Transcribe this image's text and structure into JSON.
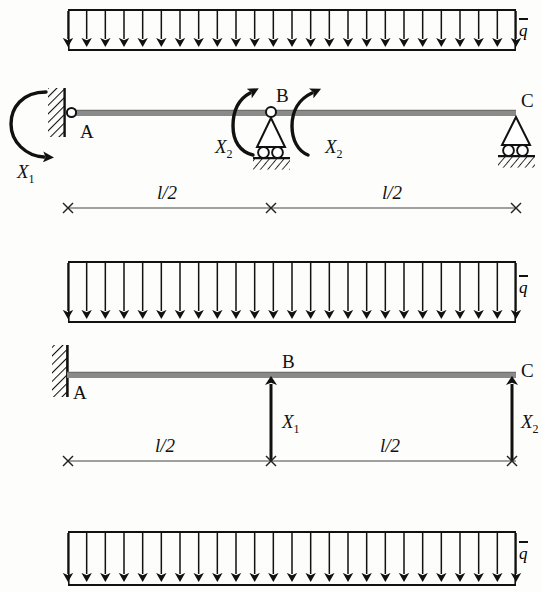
{
  "figure": {
    "type": "structural-engineering-diagram",
    "background_color": "#fdfdfb",
    "ink_color": "#111111",
    "beam_color": "#8a8a8a",
    "width": 542,
    "height": 592
  },
  "labels": {
    "point_a": "A",
    "point_b": "B",
    "point_c": "C",
    "load_q": "q",
    "half_span": "l/2",
    "x1": "X",
    "x1_sub": "1",
    "x2": "X",
    "x2_sub": "2"
  },
  "diagrams": [
    {
      "id": "primary-system-moments",
      "index": 1,
      "load": {
        "name": "uniformly-distributed-load",
        "symbol": "q",
        "overbar": true,
        "direction": "downward",
        "arrow_count": 25,
        "box_left": 68,
        "box_right": 516,
        "box_top": 10,
        "box_bottom": 50
      },
      "beam": {
        "left": 68,
        "right": 516,
        "y": 113
      },
      "supports": [
        {
          "name": "support-a",
          "label": "A",
          "type": "wall-hinge",
          "x": 68
        },
        {
          "name": "support-b",
          "label": "B",
          "type": "roller-hinge",
          "x": 271
        },
        {
          "name": "support-c",
          "label": "C",
          "type": "roller",
          "x": 516
        }
      ],
      "redundants": [
        {
          "name": "moment-x1",
          "label": "X",
          "sub": "1",
          "type": "moment",
          "at": "A"
        },
        {
          "name": "moment-x2-left",
          "label": "X",
          "sub": "2",
          "type": "moment",
          "at": "B-left"
        },
        {
          "name": "moment-x2-right",
          "label": "X",
          "sub": "2",
          "type": "moment",
          "at": "B-right"
        }
      ],
      "dimensions": [
        {
          "name": "dim-left-half",
          "label": "l/2",
          "from": 68,
          "to": 271,
          "y": 208
        },
        {
          "name": "dim-right-half",
          "label": "l/2",
          "from": 271,
          "to": 516,
          "y": 208
        }
      ]
    },
    {
      "id": "primary-system-forces",
      "index": 2,
      "load": {
        "name": "uniformly-distributed-load",
        "symbol": "q",
        "overbar": true,
        "direction": "downward",
        "arrow_count": 25,
        "box_left": 68,
        "box_right": 516,
        "box_top": 262,
        "box_bottom": 322
      },
      "beam": {
        "left": 68,
        "right": 516,
        "y": 375
      },
      "supports": [
        {
          "name": "support-a",
          "label": "A",
          "type": "fixed-wall",
          "x": 68
        },
        {
          "name": "point-b",
          "label": "B",
          "type": "free-point",
          "x": 271
        },
        {
          "name": "point-c",
          "label": "C",
          "type": "free-end",
          "x": 516
        }
      ],
      "redundants": [
        {
          "name": "force-x1",
          "label": "X",
          "sub": "1",
          "type": "force-up",
          "at": "B"
        },
        {
          "name": "force-x2",
          "label": "X",
          "sub": "2",
          "type": "force-up",
          "at": "C"
        }
      ],
      "dimensions": [
        {
          "name": "dim-left-half",
          "label": "l/2",
          "from": 68,
          "to": 271,
          "y": 461
        },
        {
          "name": "dim-right-half",
          "label": "l/2",
          "from": 271,
          "to": 516,
          "y": 461
        }
      ]
    },
    {
      "id": "third-load-partial",
      "index": 3,
      "load": {
        "name": "uniformly-distributed-load",
        "symbol": "q",
        "overbar": true,
        "direction": "downward",
        "arrow_count": 25,
        "box_left": 68,
        "box_right": 516,
        "box_top": 532,
        "box_bottom": 585
      }
    }
  ]
}
